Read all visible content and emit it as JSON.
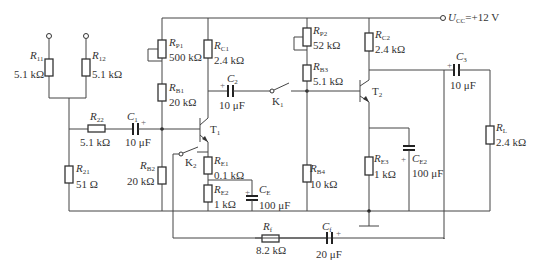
{
  "diagram": {
    "supply": {
      "symbol": "U",
      "sub": "CC",
      "value": "=+12 V"
    },
    "components": {
      "R11": {
        "sym": "R",
        "sub": "11",
        "value": "5.1 kΩ"
      },
      "R12": {
        "sym": "R",
        "sub": "12",
        "value": "5.1 kΩ"
      },
      "R22": {
        "sym": "R",
        "sub": "22",
        "value": "5.1 kΩ"
      },
      "R21": {
        "sym": "R",
        "sub": "21",
        "value": "51 Ω"
      },
      "C1": {
        "sym": "C",
        "sub": "1",
        "value": "10 μF"
      },
      "RP1": {
        "sym": "R",
        "sub": "P1",
        "value": "500 kΩ"
      },
      "RB1": {
        "sym": "R",
        "sub": "B1",
        "value": "20 kΩ"
      },
      "RB2": {
        "sym": "R",
        "sub": "B2",
        "value": "20 kΩ"
      },
      "RC1": {
        "sym": "R",
        "sub": "C1",
        "value": "2.4 kΩ"
      },
      "C2": {
        "sym": "C",
        "sub": "2",
        "value": "10 μF"
      },
      "K1": {
        "sym": "K",
        "sub": "1"
      },
      "K2": {
        "sym": "K",
        "sub": "2"
      },
      "T1": {
        "sym": "T",
        "sub": "1"
      },
      "T2": {
        "sym": "T",
        "sub": "2"
      },
      "RE1": {
        "sym": "R",
        "sub": "E1",
        "value": "0.1 kΩ"
      },
      "RE2": {
        "sym": "R",
        "sub": "E2",
        "value": "1 kΩ"
      },
      "CE1": {
        "sym": "C",
        "sub": "E",
        "value": "100 μF"
      },
      "RP2": {
        "sym": "R",
        "sub": "P2",
        "value": "52 kΩ"
      },
      "RB3": {
        "sym": "R",
        "sub": "B3",
        "value": "5.1 kΩ"
      },
      "RB4": {
        "sym": "R",
        "sub": "B4",
        "value": "10 kΩ"
      },
      "RC2": {
        "sym": "R",
        "sub": "C2",
        "value": "2.4 kΩ"
      },
      "RE3": {
        "sym": "R",
        "sub": "E3",
        "value": "1 kΩ"
      },
      "CE2": {
        "sym": "C",
        "sub": "E2",
        "value": "100 μF"
      },
      "C3": {
        "sym": "C",
        "sub": "3",
        "value": "10 μF"
      },
      "RL": {
        "sym": "R",
        "sub": "L",
        "value": "2.4 kΩ"
      },
      "Rf": {
        "sym": "R",
        "sub": "f",
        "value": "8.2 kΩ"
      },
      "Cf": {
        "sym": "C",
        "sub": "f",
        "value": "20 μF"
      }
    },
    "polarity_mark": "+"
  }
}
